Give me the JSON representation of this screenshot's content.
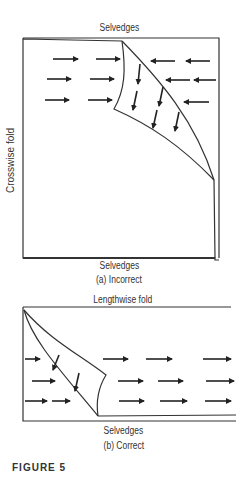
{
  "figure": {
    "label": "FIGURE 5",
    "panel_a": {
      "top_label": "Selvedges",
      "bottom_label": "Selvedges",
      "side_label": "Crosswise fold",
      "caption": "(a) Incorrect"
    },
    "panel_b": {
      "top_label": "Lengthwise fold",
      "bottom_label": "Selvedges",
      "caption": "(b) Correct"
    }
  }
}
